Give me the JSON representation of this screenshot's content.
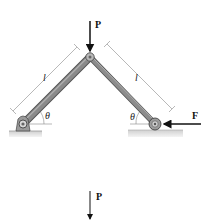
{
  "figure": {
    "loads": {
      "top_force_label": "P",
      "horizontal_force_label": "F",
      "bottom_force_label": "P"
    },
    "dimensions": {
      "left_member_length": "l",
      "right_member_length": "l",
      "left_angle": "θ",
      "right_angle": "θ"
    },
    "colors": {
      "member": "#7f7f7f",
      "member_edge": "#555555",
      "ground": "#bdbdbd",
      "arrow": "#111111",
      "dimension_line": "#999999"
    }
  }
}
